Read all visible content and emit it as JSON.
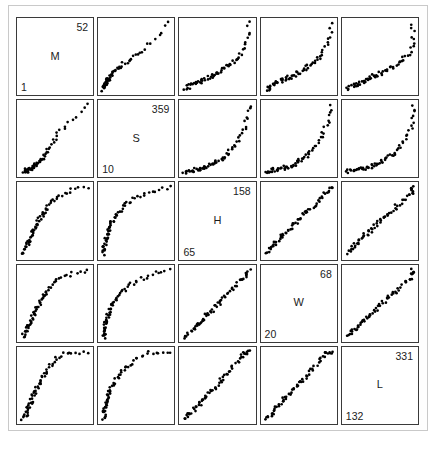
{
  "figure": {
    "type": "scatterplot-matrix",
    "caption": "",
    "width": 436,
    "height": 449,
    "point_color": "#000000",
    "panel_border_color": "#3a3a3a",
    "background_color": "#ffffff"
  },
  "variables": [
    {
      "letter": "M",
      "min": "1",
      "max": "52"
    },
    {
      "letter": "S",
      "min": "10",
      "max": "359"
    },
    {
      "letter": "H",
      "min": "65",
      "max": "158"
    },
    {
      "letter": "W",
      "min": "20",
      "max": "68"
    },
    {
      "letter": "L",
      "min": "132",
      "max": "331"
    }
  ],
  "chart_data": {
    "type": "scatter",
    "title": "",
    "xlabel": "",
    "ylabel": "",
    "grid": false,
    "legend": "none",
    "matrix_size": 5,
    "diagonal_shows": "variable-name-with-min-and-max",
    "variables": [
      {
        "name": "M",
        "range": [
          1,
          52
        ]
      },
      {
        "name": "S",
        "range": [
          10,
          359
        ]
      },
      {
        "name": "H",
        "range": [
          65,
          158
        ]
      },
      {
        "name": "W",
        "range": [
          20,
          68
        ]
      },
      {
        "name": "L",
        "range": [
          132,
          331
        ]
      }
    ],
    "n_points": 62,
    "points": {
      "M": [
        3,
        4,
        4,
        5,
        5,
        6,
        6,
        6,
        7,
        7,
        7,
        8,
        8,
        8,
        9,
        9,
        9,
        10,
        10,
        10,
        11,
        11,
        11,
        12,
        12,
        12,
        13,
        13,
        13,
        14,
        14,
        15,
        15,
        16,
        16,
        17,
        17,
        18,
        18,
        19,
        20,
        20,
        21,
        22,
        22,
        23,
        24,
        25,
        26,
        27,
        28,
        29,
        30,
        32,
        34,
        36,
        38,
        40,
        43,
        46,
        49,
        52
      ],
      "S": [
        13,
        14,
        15,
        16,
        17,
        18,
        19,
        20,
        21,
        22,
        23,
        24,
        25,
        26,
        27,
        28,
        29,
        30,
        32,
        33,
        35,
        36,
        38,
        40,
        42,
        44,
        46,
        48,
        50,
        53,
        56,
        59,
        62,
        66,
        70,
        74,
        78,
        83,
        88,
        93,
        99,
        105,
        112,
        119,
        127,
        135,
        144,
        153,
        163,
        174,
        185,
        197,
        210,
        224,
        238,
        253,
        269,
        286,
        304,
        323,
        343,
        359
      ],
      "H": [
        66,
        68,
        69,
        71,
        72,
        74,
        75,
        77,
        78,
        80,
        81,
        82,
        84,
        85,
        86,
        88,
        89,
        90,
        92,
        93,
        94,
        96,
        97,
        98,
        100,
        101,
        103,
        104,
        106,
        107,
        109,
        110,
        112,
        113,
        115,
        116,
        118,
        120,
        121,
        123,
        125,
        126,
        128,
        130,
        132,
        134,
        135,
        137,
        139,
        141,
        143,
        145,
        147,
        148,
        150,
        151,
        152,
        154,
        155,
        156,
        157,
        158
      ],
      "W": [
        21,
        22,
        22,
        23,
        24,
        24,
        25,
        26,
        26,
        27,
        28,
        28,
        29,
        30,
        30,
        31,
        32,
        32,
        33,
        34,
        34,
        35,
        36,
        37,
        37,
        38,
        39,
        40,
        40,
        41,
        42,
        43,
        44,
        44,
        45,
        46,
        47,
        48,
        49,
        50,
        50,
        51,
        52,
        53,
        54,
        55,
        56,
        57,
        58,
        59,
        60,
        61,
        62,
        62,
        63,
        64,
        65,
        66,
        66,
        67,
        67,
        68
      ],
      "L": [
        136,
        139,
        142,
        145,
        148,
        151,
        154,
        157,
        160,
        163,
        166,
        169,
        172,
        175,
        178,
        181,
        184,
        187,
        190,
        193,
        196,
        199,
        202,
        205,
        208,
        211,
        215,
        218,
        221,
        225,
        228,
        232,
        235,
        239,
        243,
        246,
        250,
        254,
        258,
        262,
        266,
        270,
        274,
        278,
        283,
        287,
        291,
        296,
        300,
        305,
        309,
        314,
        318,
        322,
        326,
        329,
        330,
        331,
        331,
        331,
        331,
        331
      ]
    },
    "pair_relationships": [
      {
        "x": "S",
        "y": "M",
        "shape": "positive-linear-with-dense-lower-left-cluster"
      },
      {
        "x": "H",
        "y": "M",
        "shape": "positive-linear-with-dense-lower-left-cluster"
      },
      {
        "x": "W",
        "y": "M",
        "shape": "positive-linear-with-dense-lower-left-cluster"
      },
      {
        "x": "L",
        "y": "M",
        "shape": "positive-linear-with-dense-lower-left-cluster"
      },
      {
        "x": "M",
        "y": "S",
        "shape": "exponential-curve-increasing"
      },
      {
        "x": "H",
        "y": "S",
        "shape": "exponential-curve-increasing"
      },
      {
        "x": "W",
        "y": "S",
        "shape": "exponential-curve-increasing"
      },
      {
        "x": "L",
        "y": "S",
        "shape": "exponential-curve-increasing"
      },
      {
        "x": "M",
        "y": "H",
        "shape": "positive-linear-tight"
      },
      {
        "x": "S",
        "y": "H",
        "shape": "logarithmic-curve-increasing"
      },
      {
        "x": "W",
        "y": "H",
        "shape": "positive-linear-tight"
      },
      {
        "x": "L",
        "y": "H",
        "shape": "positive-linear-tight"
      },
      {
        "x": "M",
        "y": "W",
        "shape": "positive-linear-tight"
      },
      {
        "x": "S",
        "y": "W",
        "shape": "logarithmic-curve-increasing"
      },
      {
        "x": "H",
        "y": "W",
        "shape": "positive-linear-tight"
      },
      {
        "x": "L",
        "y": "W",
        "shape": "positive-linear-tight"
      },
      {
        "x": "M",
        "y": "L",
        "shape": "positive-linear-saturating"
      },
      {
        "x": "S",
        "y": "L",
        "shape": "logarithmic-curve-increasing"
      },
      {
        "x": "H",
        "y": "L",
        "shape": "positive-linear-saturating"
      },
      {
        "x": "W",
        "y": "L",
        "shape": "positive-linear-saturating"
      }
    ]
  }
}
